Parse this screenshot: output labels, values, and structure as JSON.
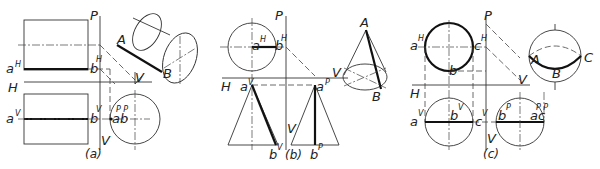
{
  "figure": {
    "panels": [
      {
        "id": "a",
        "caption": "(a)",
        "solid": "cylinder",
        "labels": {
          "plane_p": "P",
          "plane_h": "H",
          "plane_v_bottom": "V",
          "plane_v_pictorial": "V",
          "a_h": "a",
          "a_h_sup": "H",
          "b_h": "b",
          "b_h_sup": "H",
          "a_v": "a",
          "a_v_sup": "V",
          "b_v": "b",
          "b_v_sup": "V",
          "ab_p": "ab",
          "ab_p_sup": "P P",
          "pict_a": "A",
          "pict_b": "B"
        }
      },
      {
        "id": "b",
        "caption": "(b)",
        "solid": "cone",
        "labels": {
          "plane_p": "P",
          "plane_h": "H",
          "plane_v_bottom": "V",
          "plane_v_pictorial": "V",
          "a_h": "a",
          "a_h_sup": "H",
          "b_h": "b",
          "b_h_sup": "H",
          "a_v": "a",
          "a_v_sup": "V",
          "b_v": "b",
          "b_v_sup": "V",
          "a_p": "a",
          "a_p_sup": "P",
          "b_p": "b",
          "b_p_sup": "P",
          "pict_a": "A",
          "pict_b": "B"
        }
      },
      {
        "id": "c",
        "caption": "(c)",
        "solid": "sphere",
        "labels": {
          "plane_p": "P",
          "plane_h": "H",
          "plane_v_bottom": "V",
          "plane_v_pictorial": "V",
          "a_h": "a",
          "a_h_sup": "H",
          "b_h": "b",
          "c_h": "c",
          "c_h_sup": "H",
          "a_v": "a",
          "a_v_sup": "V",
          "b_v": "b",
          "b_v_sup": "V",
          "c_v": "c",
          "c_v_sup": "V",
          "b_p": "b",
          "b_p_sup": "P",
          "ac_p": "ac",
          "ac_p_sup": "P P",
          "pict_a": "A",
          "pict_b": "B",
          "pict_c": "C"
        }
      }
    ]
  }
}
